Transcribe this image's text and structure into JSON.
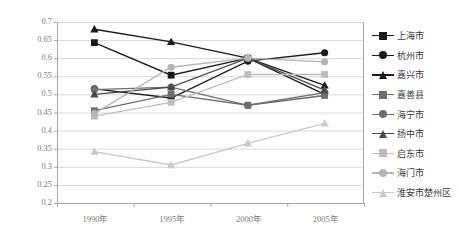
{
  "chart_data": {
    "type": "line",
    "title": "",
    "xlabel": "",
    "ylabel": "",
    "categories": [
      "1990年",
      "1995年",
      "2000年",
      "2005年"
    ],
    "ylim": [
      0.2,
      0.7
    ],
    "ytick_labels": [
      "0.7",
      "0.65",
      "0.6",
      "0.55",
      "0.5",
      "0.45",
      "0.4",
      "0.35",
      "0.3",
      "0.25",
      "0.2"
    ],
    "ytick_values": [
      0.7,
      0.65,
      0.6,
      0.55,
      0.5,
      0.45,
      0.4,
      0.35,
      0.3,
      0.25,
      0.2
    ],
    "grid": true,
    "legend_position": "right",
    "series": [
      {
        "name": "上海市",
        "marker": "square",
        "color": "#1a1a1a",
        "values": [
          0.643,
          0.553,
          0.6,
          0.5
        ]
      },
      {
        "name": "杭州市",
        "marker": "circle",
        "color": "#1a1a1a",
        "values": [
          0.515,
          0.49,
          0.592,
          0.615
        ]
      },
      {
        "name": "嘉兴市",
        "marker": "triangle",
        "color": "#1a1a1a",
        "values": [
          0.68,
          0.645,
          0.6,
          0.525
        ]
      },
      {
        "name": "嘉善县",
        "marker": "square",
        "color": "#6e6e6e",
        "values": [
          0.455,
          0.5,
          0.47,
          0.497
        ]
      },
      {
        "name": "海宁市",
        "marker": "circle",
        "color": "#6e6e6e",
        "values": [
          0.513,
          0.52,
          0.47,
          0.505
        ]
      },
      {
        "name": "扬中市",
        "marker": "triangle",
        "color": "#4a4a4a",
        "values": [
          0.5,
          0.52,
          0.6,
          0.512
        ]
      },
      {
        "name": "启东市",
        "marker": "square",
        "color": "#bdbdbd",
        "values": [
          0.44,
          0.478,
          0.555,
          0.555
        ]
      },
      {
        "name": "海门市",
        "marker": "circle",
        "color": "#b5b5b5",
        "values": [
          0.447,
          0.575,
          0.6,
          0.59
        ]
      },
      {
        "name": "淮安市楚州区",
        "marker": "triangle",
        "color": "#c9c9c9",
        "values": [
          0.342,
          0.305,
          0.365,
          0.42
        ]
      }
    ]
  },
  "axis": {
    "tick_color": "#7a7a7a",
    "grid_color": "#d9d9d9",
    "axis_color": "#a6a6a6"
  }
}
